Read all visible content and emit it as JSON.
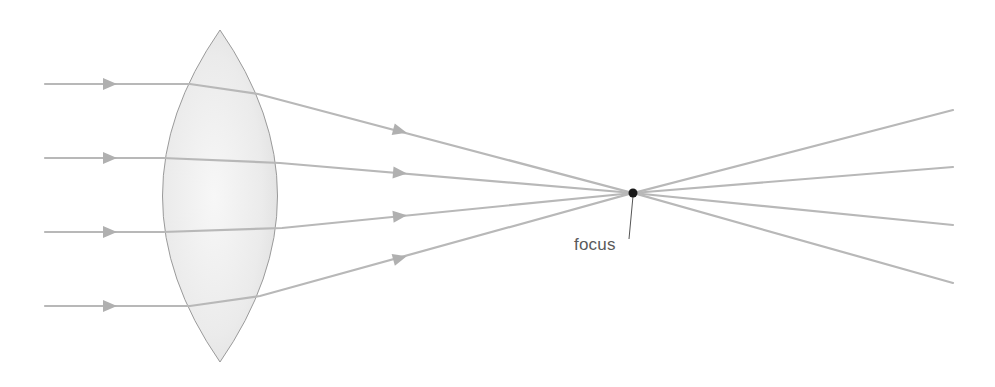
{
  "diagram": {
    "title": "",
    "type": "converging-lens-ray-diagram",
    "labels": {
      "focus": "focus"
    },
    "colors": {
      "ray": "#b8b8b8",
      "lens_outline": "#9a9a9a",
      "lens_fill_center": "#f4f4f4",
      "lens_fill_edge": "#e4e4e4",
      "focus_point": "#1a1a1a",
      "label_text": "#5a5a5a",
      "leader_line": "#555555"
    },
    "lens": {
      "shape": "biconvex",
      "top_tip": [
        220,
        30
      ],
      "bottom_tip": [
        220,
        362
      ],
      "left_extent_x": 160,
      "right_extent_x": 282
    },
    "focus_point": [
      633,
      193
    ],
    "rays": [
      {
        "id": 1,
        "incoming_y": 84,
        "outgoing_end_y": 110
      },
      {
        "id": 2,
        "incoming_y": 158,
        "outgoing_end_y": 167
      },
      {
        "id": 3,
        "incoming_y": 232,
        "outgoing_end_y": 225
      },
      {
        "id": 4,
        "incoming_y": 306,
        "outgoing_end_y": 283
      }
    ]
  }
}
